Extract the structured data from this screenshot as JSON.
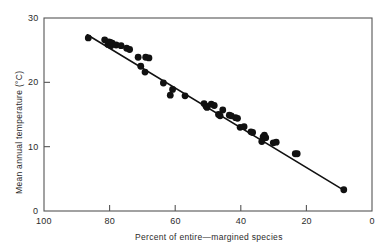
{
  "chart_data": {
    "type": "scatter",
    "title": "",
    "xlabel": "Percent of entire—margined species",
    "ylabel": "Mean annual temperature (°C)",
    "xlim": [
      100,
      0
    ],
    "ylim": [
      0,
      30
    ],
    "x_reversed": true,
    "grid": false,
    "legend": null,
    "xticks": [
      100,
      80,
      60,
      40,
      20,
      0
    ],
    "xtick_labels": [
      "100",
      "80",
      "60",
      "40",
      "20",
      "0"
    ],
    "yticks": [
      0,
      10,
      20,
      30
    ],
    "ytick_labels": [
      "0",
      "10",
      "20",
      "30"
    ],
    "marker": {
      "shape": "circle",
      "color": "#111111",
      "size": 3.4
    },
    "points": [
      [
        86.5,
        26.9
      ],
      [
        81.5,
        26.6
      ],
      [
        80.5,
        25.9
      ],
      [
        80.2,
        26.3
      ],
      [
        79.8,
        26.2
      ],
      [
        79.6,
        25.7
      ],
      [
        79.2,
        26.1
      ],
      [
        78.0,
        25.8
      ],
      [
        76.5,
        25.7
      ],
      [
        74.8,
        25.3
      ],
      [
        73.9,
        25.1
      ],
      [
        71.3,
        23.9
      ],
      [
        70.5,
        22.5
      ],
      [
        69.2,
        21.6
      ],
      [
        69.0,
        23.9
      ],
      [
        68.0,
        23.8
      ],
      [
        63.6,
        19.9
      ],
      [
        60.8,
        18.9
      ],
      [
        61.5,
        18.0
      ],
      [
        57.0,
        17.9
      ],
      [
        51.2,
        16.7
      ],
      [
        50.6,
        16.3
      ],
      [
        50.3,
        16.1
      ],
      [
        49.0,
        16.6
      ],
      [
        48.1,
        16.4
      ],
      [
        46.8,
        15.0
      ],
      [
        46.3,
        14.8
      ],
      [
        45.5,
        15.7
      ],
      [
        43.5,
        14.9
      ],
      [
        42.9,
        14.8
      ],
      [
        41.6,
        14.5
      ],
      [
        41.0,
        14.4
      ],
      [
        40.2,
        13.0
      ],
      [
        39.0,
        13.1
      ],
      [
        36.9,
        12.3
      ],
      [
        36.4,
        12.2
      ],
      [
        33.2,
        11.5
      ],
      [
        32.8,
        11.8
      ],
      [
        32.4,
        11.4
      ],
      [
        33.6,
        10.8
      ],
      [
        30.1,
        10.6
      ],
      [
        29.2,
        10.7
      ],
      [
        23.4,
        8.9
      ],
      [
        22.8,
        8.9
      ],
      [
        8.6,
        3.3
      ]
    ],
    "fit_line": {
      "label": "regression line",
      "points": [
        [
          86.8,
          27.4
        ],
        [
          8.5,
          3.2
        ]
      ],
      "color": "#111111",
      "width": 1.6
    }
  }
}
